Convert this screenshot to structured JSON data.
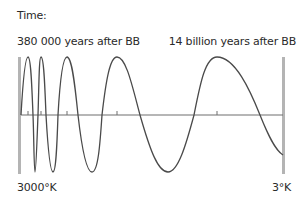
{
  "labels": {
    "time": "Time:",
    "start_time": "380 000 years after BB",
    "end_time": "14 billion years after BB",
    "start_temperature": "3000°K",
    "end_temperature": "3°K"
  },
  "colors": {
    "wave": "#4a4a4a",
    "axis": "#6e6e6e",
    "bars": "#b4b4b4",
    "text": "#2a2a2a"
  },
  "diagram": {
    "tick_positions_x": [
      28,
      41,
      67,
      117,
      217
    ]
  }
}
